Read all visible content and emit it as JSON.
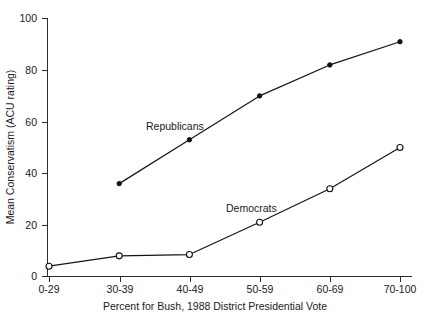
{
  "chart_data": {
    "type": "line",
    "title": "",
    "xlabel": "Percent for Bush, 1988 District Presidential Vote",
    "ylabel": "Mean Conservatism (ACU rating)",
    "categories": [
      "0-29",
      "30-39",
      "40-49",
      "50-59",
      "60-69",
      "70-100"
    ],
    "yticks": [
      0,
      20,
      40,
      60,
      80,
      100
    ],
    "ylim": [
      0,
      100
    ],
    "grid": false,
    "legend_position": "inline-annotation",
    "series": [
      {
        "name": "Republicans",
        "marker": "filled-circle",
        "values": [
          null,
          36,
          53,
          70,
          82,
          91
        ]
      },
      {
        "name": "Democrats",
        "marker": "open-circle",
        "values": [
          4,
          8,
          8.5,
          21,
          34,
          50
        ]
      }
    ],
    "annotations": [
      {
        "text": "Republicans",
        "x_px": 146,
        "y_px": 126
      },
      {
        "text": "Democrats",
        "x_px": 226,
        "y_px": 212
      }
    ]
  },
  "axis": {
    "y_tick_labels": [
      "0",
      "20",
      "40",
      "60",
      "80",
      "100"
    ],
    "x_tick_labels": [
      "0-29",
      "30-39",
      "40-49",
      "50-59",
      "60-69",
      "70-100"
    ],
    "y_title": "Mean Conservatism (ACU rating)",
    "x_title": "Percent for Bush, 1988 District Presidential Vote"
  },
  "colors": {
    "axis": "#2b2b2b",
    "line": "#141414",
    "marker_fill_republicans": "#101010",
    "marker_fill_democrats": "#ffffff",
    "background": "#ffffff"
  }
}
